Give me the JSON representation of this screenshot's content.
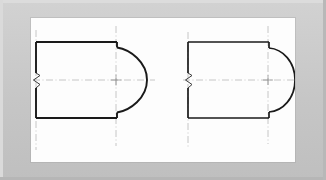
{
  "document": {
    "type": "engineering-drawing",
    "title": "Sectional end views — two cylindrical end profiles",
    "sheet_color": "#fdfdfd",
    "mount_color": "#c8c8c8",
    "ink_color": "#1a1a1a",
    "construction_color": "#9a9a9a"
  },
  "figures": [
    {
      "id": "figure-left",
      "label": "Left view — flattened / elliptical end",
      "break_symbol": "zigzag-break",
      "center_mark": "plus-cross",
      "body": {
        "left_x": 36,
        "right_x": 116,
        "top_y": 42,
        "bottom_y": 118,
        "center_x": 114,
        "center_y": 80
      },
      "arc": {
        "kind": "elliptical-end",
        "radius_x": 30,
        "radius_y": 42,
        "tip_x": 147
      },
      "notch": {
        "width": 5,
        "height": 5,
        "description": "square step where arc meets the straight edges"
      }
    },
    {
      "id": "figure-right",
      "label": "Right view — semicircular end",
      "break_symbol": "zigzag-break",
      "center_mark": "plus-cross",
      "body": {
        "left_x": 190,
        "right_x": 270,
        "top_y": 42,
        "bottom_y": 118,
        "center_x": 268,
        "center_y": 80
      },
      "arc": {
        "kind": "semicircle",
        "radius_x": 28,
        "radius_y": 38,
        "tip_x": 298
      },
      "notch": {
        "width": 5,
        "height": 5,
        "description": "square step where arc meets the straight edges"
      }
    }
  ],
  "line_weights": {
    "object_line": 1.9,
    "centerline": 0.55,
    "break_line": 1.0
  },
  "centerlines": {
    "horizontal": "long-dash through each figure center",
    "vertical": "long-dash at each figure's left break edge and arc origin"
  },
  "annotations": {
    "center_mark_glyph": "+",
    "break_glyph": "Z"
  }
}
